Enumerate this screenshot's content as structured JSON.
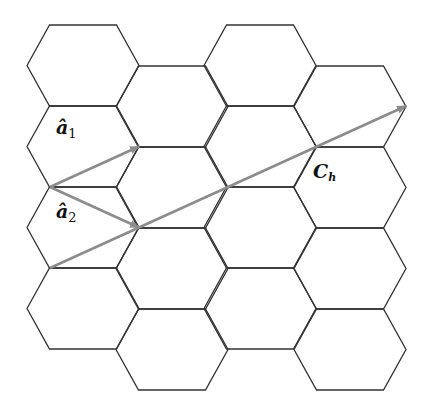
{
  "diagram": {
    "title": "",
    "lattice": {
      "type": "hexagonal",
      "columns": 4,
      "hexes_per_column": [
        4,
        4,
        4,
        4
      ],
      "line_color": "#333333"
    },
    "vectors": [
      {
        "id": "a1",
        "label_main": "â",
        "label_sub": "1",
        "from": [
          0,
          0
        ],
        "to": [
          1,
          1
        ],
        "color": "#8c8c8c"
      },
      {
        "id": "a2",
        "label_main": "â",
        "label_sub": "2",
        "from": [
          0,
          0
        ],
        "to": [
          1,
          -1
        ],
        "color": "#8c8c8c"
      },
      {
        "id": "Ch",
        "label_main": "C",
        "label_sub": "h",
        "from": [
          0,
          -2
        ],
        "to": [
          4,
          2
        ],
        "color": "#8c8c8c"
      }
    ]
  }
}
